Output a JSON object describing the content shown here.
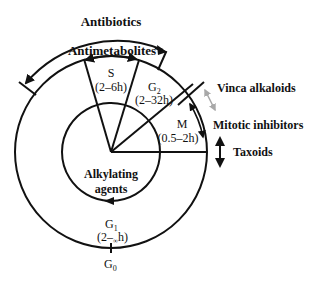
{
  "diagram": {
    "type": "cell-cycle",
    "center": [
      111,
      152
    ],
    "inner_radius": 49,
    "outer_radius": 96
  },
  "labels": {
    "antibiotics": "Antibiotics",
    "antimetabolites": "Antimetabolites",
    "s_phase": "S",
    "s_duration": "(2–6h)",
    "g2_phase": "G",
    "g2_sub": "2",
    "g2_duration": "(2–32h)",
    "m_phase": "M",
    "m_duration": "(0.5–2h)",
    "g1_phase": "G",
    "g1_sub": "1",
    "g1_duration_pre": "(2–",
    "g1_duration_inf": "∞",
    "g1_duration_post": "h)",
    "g0_phase": "G",
    "g0_sub": "0",
    "alkylating_line1": "Alkylating",
    "alkylating_line2": "agents",
    "vinca": "Vinca alkaloids",
    "mitotic": "Mitotic inhibitors",
    "taxoids": "Taxoids"
  },
  "colors": {
    "stroke": "#111111",
    "vinca_arrow": "#a8a8a8"
  }
}
